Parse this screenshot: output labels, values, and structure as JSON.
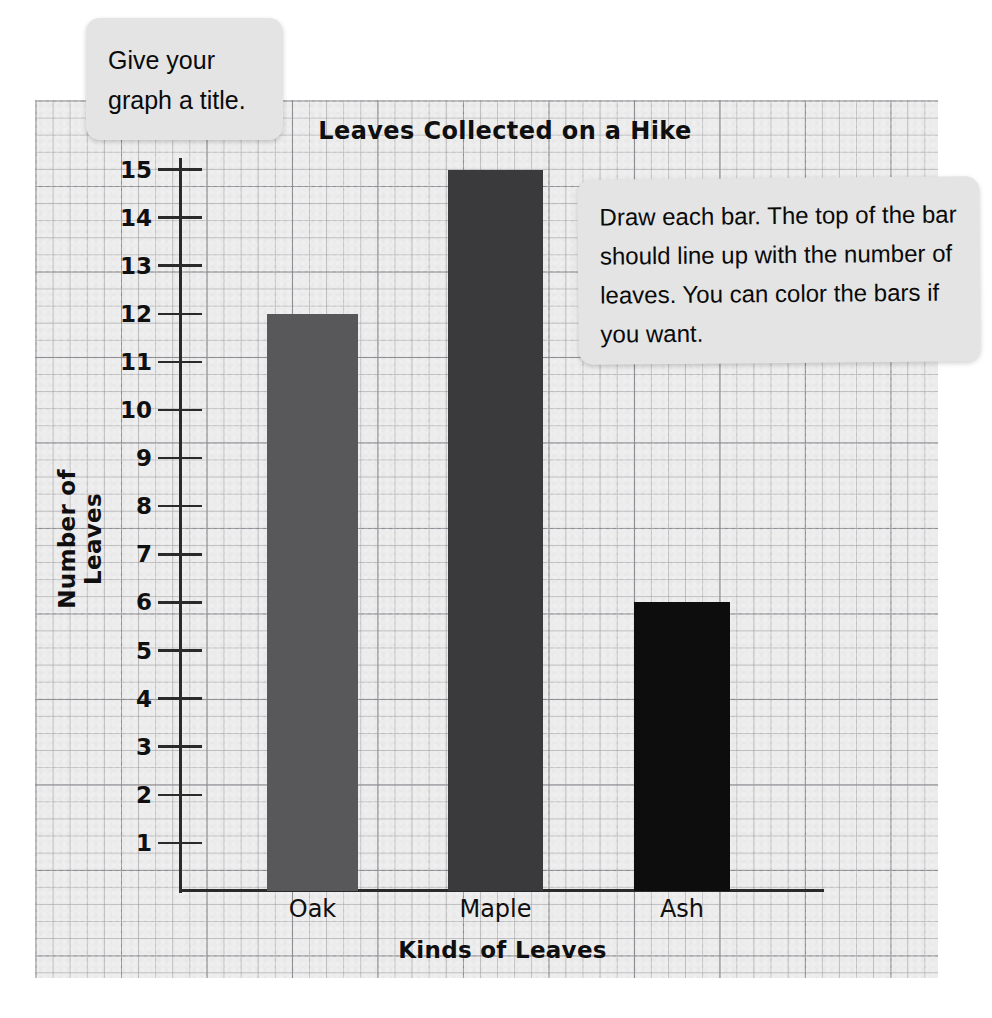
{
  "worksheet": {
    "callouts": [
      {
        "id": "give-title",
        "text": "Give your graph a title."
      },
      {
        "id": "draw-bars",
        "text": "Draw each bar. The top of the bar should line up with the number of leaves. You can color the bars if you want."
      }
    ]
  },
  "chart_data": {
    "type": "bar",
    "title": "Leaves Collected on a Hike",
    "xlabel": "Kinds of Leaves",
    "ylabel": "Number of Leaves",
    "categories": [
      "Oak",
      "Maple",
      "Ash"
    ],
    "values": [
      12,
      15,
      6
    ],
    "colors": [
      "#58585a",
      "#3a3a3c",
      "#0d0d0d"
    ],
    "ylim": [
      0,
      15
    ],
    "yticks": [
      15,
      14,
      13,
      12,
      11,
      10,
      9,
      8,
      7,
      6,
      5,
      4,
      3,
      2,
      1
    ],
    "ytick_labels": [
      "15",
      "14",
      "13",
      "12",
      "11",
      "10",
      "9",
      "8",
      "7",
      "6",
      "5",
      "4",
      "3",
      "2",
      "1"
    ],
    "grid": true,
    "grid_style": "graph-paper",
    "legend": "none",
    "paper_color": "#ececec",
    "axis_color": "#2a2a2a"
  }
}
